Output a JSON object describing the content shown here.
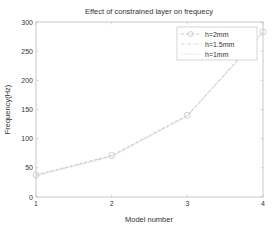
{
  "chart_data": {
    "type": "line",
    "title": "Effect of constrained layer on frequecy",
    "xlabel": "Model number",
    "ylabel": "Frequency(Hz)",
    "x": [
      1,
      2,
      3,
      4
    ],
    "xlim": [
      1,
      4
    ],
    "ylim": [
      0,
      300
    ],
    "xticks": [
      1,
      2,
      3,
      4
    ],
    "yticks": [
      0,
      50,
      100,
      150,
      200,
      250,
      300
    ],
    "grid": false,
    "legend_position": "upper right",
    "series": [
      {
        "name": "h=2mm",
        "values": [
          38,
          71,
          140,
          283
        ],
        "marker": "circle",
        "linestyle": "dashed",
        "color": "#c8c8c8"
      },
      {
        "name": "h=1.5mm",
        "values": [
          37,
          70,
          139,
          282
        ],
        "marker": "none",
        "linestyle": "dashed",
        "color": "#d4d4d4"
      },
      {
        "name": "h=1mm",
        "values": [
          36,
          69,
          138,
          281
        ],
        "marker": "none",
        "linestyle": "dashed",
        "color": "#dedede"
      }
    ]
  },
  "layout": {
    "plot_left": 36,
    "plot_right": 263,
    "plot_top": 22,
    "plot_bottom": 197,
    "axis_color": "#bbbbbb"
  }
}
